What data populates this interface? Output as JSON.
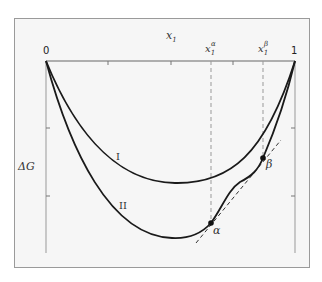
{
  "figure": {
    "x_axis_label": "x",
    "x_axis_sub": "1",
    "y_axis_label": "ΔG",
    "x_tick_left": "0",
    "x_tick_right": "1",
    "marker_alpha_label": "x",
    "marker_alpha_sub": "1",
    "marker_alpha_sup": "α",
    "marker_beta_label": "x",
    "marker_beta_sub": "1",
    "marker_beta_sup": "β",
    "curve_I_label": "I",
    "curve_II_label": "II",
    "point_alpha": "α",
    "point_beta": "β"
  },
  "colors": {
    "panel_bg": "#f6f6f6",
    "curve": "#1a1a1a",
    "axis": "#888888",
    "dashed": "#999999"
  }
}
